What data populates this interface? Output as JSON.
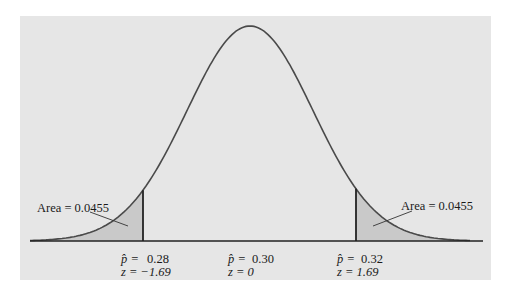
{
  "chart_data": {
    "type": "area",
    "title": "",
    "xlabel": "",
    "ylabel": "",
    "distribution": "normal",
    "mean_phat": 0.3,
    "cutoffs": [
      {
        "phat": "0.28",
        "z": "−1.69",
        "tail": "left",
        "area": "0.0455"
      },
      {
        "phat": "0.32",
        "z": "1.69",
        "tail": "right",
        "area": "0.0455"
      }
    ],
    "tick_labels": [
      {
        "phat_label": "p̂ =",
        "phat_value": "0.28",
        "z_label": "z = −1.69"
      },
      {
        "phat_label": "p̂ =",
        "phat_value": "0.30",
        "z_label": "z = 0"
      },
      {
        "phat_label": "p̂ =",
        "phat_value": "0.32",
        "z_label": "z = 1.69"
      }
    ],
    "annotations": [
      "Area = 0.0455",
      "Area = 0.0455"
    ],
    "grid": false,
    "legend": false
  },
  "labels": {
    "left_area": "Area = 0.0455",
    "right_area": "Area = 0.0455",
    "left_phat_prefix": "p̂ =",
    "left_phat_value": "0.28",
    "left_z": "z = −1.69",
    "center_phat_prefix": "p̂ =",
    "center_phat_value": "0.30",
    "center_z": "z = 0",
    "right_phat_prefix": "p̂ =",
    "right_phat_value": "0.32",
    "right_z": "z = 1.69"
  },
  "colors": {
    "panel": "#e6e6e6",
    "curve": "#4a4a4a",
    "shade": "#c9c9c9",
    "axis": "#222222"
  }
}
